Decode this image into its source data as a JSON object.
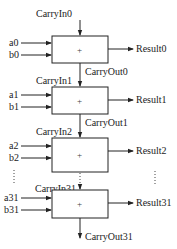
{
  "diagram": {
    "colors": {
      "stroke": "#222222",
      "background": "#ffffff"
    },
    "stages": [
      {
        "carry_in": "CarryIn0",
        "a": "a0",
        "b": "b0",
        "op": "+",
        "result": "Result0",
        "carry_out": "CarryOut0"
      },
      {
        "carry_in": "CarryIn1",
        "a": "a1",
        "b": "b1",
        "op": "+",
        "result": "Result1",
        "carry_out": "CarryOut1"
      },
      {
        "carry_in": "CarryIn2",
        "a": "a2",
        "b": "b2",
        "op": "+",
        "result": "Result2",
        "carry_out": ""
      },
      {
        "carry_in": "CarryIn31",
        "a": "a31",
        "b": "b31",
        "op": "+",
        "result": "Result31",
        "carry_out": "CarryOut31"
      }
    ],
    "ellipsis": "⋮"
  }
}
